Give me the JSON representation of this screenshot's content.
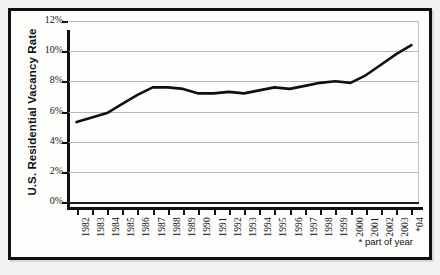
{
  "chart_data": {
    "type": "line",
    "title": "",
    "xlabel": "",
    "ylabel": "U.S. Residential Vacancy Rate",
    "ylim": [
      0,
      12
    ],
    "ytick_labels": [
      "0%",
      "2%",
      "4%",
      "6%",
      "8%",
      "10%",
      "12%"
    ],
    "ytick_values": [
      0,
      2,
      4,
      6,
      8,
      10,
      12
    ],
    "grid": true,
    "legend": null,
    "categories": [
      "1982",
      "1983",
      "1984",
      "1985",
      "1986",
      "1987",
      "1988",
      "1989",
      "1990",
      "1991",
      "1992",
      "1993",
      "1994",
      "1995",
      "1996",
      "1997",
      "1998",
      "1999",
      "2000",
      "2001",
      "2002",
      "2003",
      "*04"
    ],
    "values": [
      5.3,
      5.6,
      5.9,
      6.5,
      7.1,
      7.6,
      7.6,
      7.5,
      7.2,
      7.2,
      7.3,
      7.2,
      7.4,
      7.6,
      7.5,
      7.7,
      7.9,
      8.0,
      7.9,
      8.4,
      9.1,
      9.8,
      10.4
    ],
    "series": [
      {
        "name": "U.S. Residential Vacancy Rate",
        "values": [
          5.3,
          5.6,
          5.9,
          6.5,
          7.1,
          7.6,
          7.6,
          7.5,
          7.2,
          7.2,
          7.3,
          7.2,
          7.4,
          7.6,
          7.5,
          7.7,
          7.9,
          8.0,
          7.9,
          8.4,
          9.1,
          9.8,
          10.4
        ],
        "color": "#101010"
      }
    ],
    "annotations": [
      "* part of year"
    ]
  },
  "axis": {
    "y_title": "U.S. Residential Vacancy Rate"
  },
  "footnote": {
    "text": "* part of year"
  },
  "colors": {
    "line": "#101010",
    "grid": "#b9b9b9",
    "axis": "#111111",
    "background": "#fdfdfb",
    "page": "#f2f2f0"
  }
}
